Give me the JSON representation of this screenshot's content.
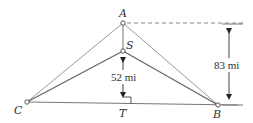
{
  "diagram": {
    "type": "geometry-figure",
    "colors": {
      "line": "#8a8a8a",
      "dark_line": "#555555",
      "text": "#333333",
      "background": "#ffffff"
    },
    "points": {
      "A": {
        "label": "A",
        "x": 123,
        "y": 23
      },
      "S": {
        "label": "S",
        "x": 123,
        "y": 51
      },
      "C": {
        "label": "C",
        "x": 27,
        "y": 102
      },
      "B": {
        "label": "B",
        "x": 218,
        "y": 105
      },
      "T": {
        "label": "T",
        "x": 123,
        "y": 104
      }
    },
    "segments": [
      {
        "from": "A",
        "to": "C"
      },
      {
        "from": "A",
        "to": "B"
      },
      {
        "from": "S",
        "to": "C"
      },
      {
        "from": "S",
        "to": "B"
      },
      {
        "from": "A",
        "to": "S"
      },
      {
        "from": "C",
        "to": "B"
      }
    ],
    "dimensions": {
      "ST": {
        "label": "52 mi",
        "value": 52,
        "unit": "mi"
      },
      "height_A": {
        "label": "83 mi",
        "value": 83,
        "unit": "mi"
      }
    },
    "annotations": {
      "right_angle_at": "T"
    }
  }
}
